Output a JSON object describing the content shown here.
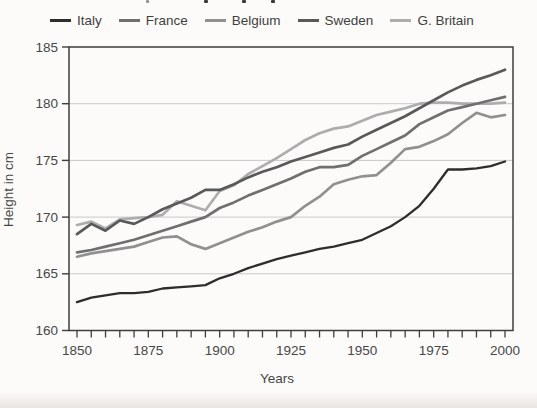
{
  "chart_data": {
    "type": "line",
    "title": "",
    "xlabel": "Years",
    "ylabel": "Height in cm",
    "xlim": [
      1850,
      2000
    ],
    "ylim": [
      160,
      185
    ],
    "yticks": [
      160,
      165,
      170,
      175,
      180,
      185
    ],
    "xticks_major": [
      1850,
      1875,
      1900,
      1925,
      1950,
      1975,
      2000
    ],
    "xtick_minor_step": 5,
    "grid": "horizontal",
    "legend_position": "top",
    "x": [
      1850,
      1855,
      1860,
      1865,
      1870,
      1875,
      1880,
      1885,
      1890,
      1895,
      1900,
      1905,
      1910,
      1915,
      1920,
      1925,
      1930,
      1935,
      1940,
      1945,
      1950,
      1955,
      1960,
      1965,
      1970,
      1975,
      1980,
      1985,
      1990,
      1995,
      2000
    ],
    "series": [
      {
        "name": "Italy",
        "color": "#2d2d2d",
        "values": [
          162.5,
          162.9,
          163.1,
          163.3,
          163.3,
          163.4,
          163.7,
          163.8,
          163.9,
          164.0,
          164.6,
          165.0,
          165.5,
          165.9,
          166.3,
          166.6,
          166.9,
          167.2,
          167.4,
          167.7,
          168.0,
          168.6,
          169.2,
          170.0,
          171.0,
          172.5,
          174.2,
          174.2,
          174.3,
          174.5,
          174.9
        ]
      },
      {
        "name": "France",
        "color": "#6f6f6f",
        "values": [
          166.9,
          167.1,
          167.4,
          167.7,
          168.0,
          168.4,
          168.8,
          169.2,
          169.6,
          170.0,
          170.8,
          171.3,
          171.9,
          172.4,
          172.9,
          173.4,
          174.0,
          174.4,
          174.4,
          174.6,
          175.4,
          176.0,
          176.6,
          177.2,
          178.2,
          178.8,
          179.4,
          179.7,
          180.0,
          180.3,
          180.6
        ]
      },
      {
        "name": "Belgium",
        "color": "#909090",
        "values": [
          166.5,
          166.8,
          167.0,
          167.2,
          167.4,
          167.8,
          168.2,
          168.3,
          167.6,
          167.2,
          167.7,
          168.2,
          168.7,
          169.1,
          169.6,
          170.0,
          171.0,
          171.8,
          172.9,
          173.3,
          173.6,
          173.7,
          174.8,
          176.0,
          176.2,
          176.7,
          177.3,
          178.3,
          179.2,
          178.8,
          179.0
        ]
      },
      {
        "name": "Sweden",
        "color": "#595959",
        "values": [
          168.5,
          169.4,
          168.8,
          169.7,
          169.4,
          170.0,
          170.7,
          171.2,
          171.7,
          172.4,
          172.4,
          172.9,
          173.5,
          174.0,
          174.4,
          174.9,
          175.3,
          175.7,
          176.1,
          176.4,
          177.1,
          177.7,
          178.3,
          178.9,
          179.6,
          180.3,
          181.0,
          181.6,
          182.1,
          182.5,
          183.0
        ]
      },
      {
        "name": "G. Britain",
        "color": "#adadad",
        "values": [
          169.3,
          169.6,
          169.0,
          169.8,
          169.9,
          170.0,
          170.2,
          171.4,
          171.0,
          170.6,
          172.3,
          172.8,
          173.8,
          174.5,
          175.2,
          176.0,
          176.8,
          177.4,
          177.8,
          178.0,
          178.5,
          179.0,
          179.3,
          179.6,
          180.0,
          180.1,
          180.1,
          180.0,
          180.0,
          180.0,
          180.1
        ]
      }
    ]
  },
  "colors": {
    "axis": "#3e3e3e",
    "grid": "#c9c9c9",
    "tick_text": "#474747"
  }
}
